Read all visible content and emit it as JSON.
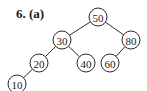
{
  "title": "6. (a)",
  "tree": {
    "type": "binary-search-tree",
    "nodes": [
      {
        "id": "n50",
        "label": "50",
        "x": 98,
        "y": 17
      },
      {
        "id": "n30",
        "label": "30",
        "x": 62,
        "y": 40
      },
      {
        "id": "n80",
        "label": "80",
        "x": 131,
        "y": 40
      },
      {
        "id": "n20",
        "label": "20",
        "x": 39,
        "y": 63
      },
      {
        "id": "n40",
        "label": "40",
        "x": 86,
        "y": 63
      },
      {
        "id": "n60",
        "label": "60",
        "x": 110,
        "y": 63
      },
      {
        "id": "n10",
        "label": "10",
        "x": 17,
        "y": 84
      }
    ],
    "edges": [
      {
        "from": "n50",
        "to": "n30"
      },
      {
        "from": "n50",
        "to": "n80"
      },
      {
        "from": "n30",
        "to": "n20"
      },
      {
        "from": "n30",
        "to": "n40"
      },
      {
        "from": "n80",
        "to": "n60"
      },
      {
        "from": "n20",
        "to": "n10"
      }
    ],
    "node_radius": 9
  }
}
